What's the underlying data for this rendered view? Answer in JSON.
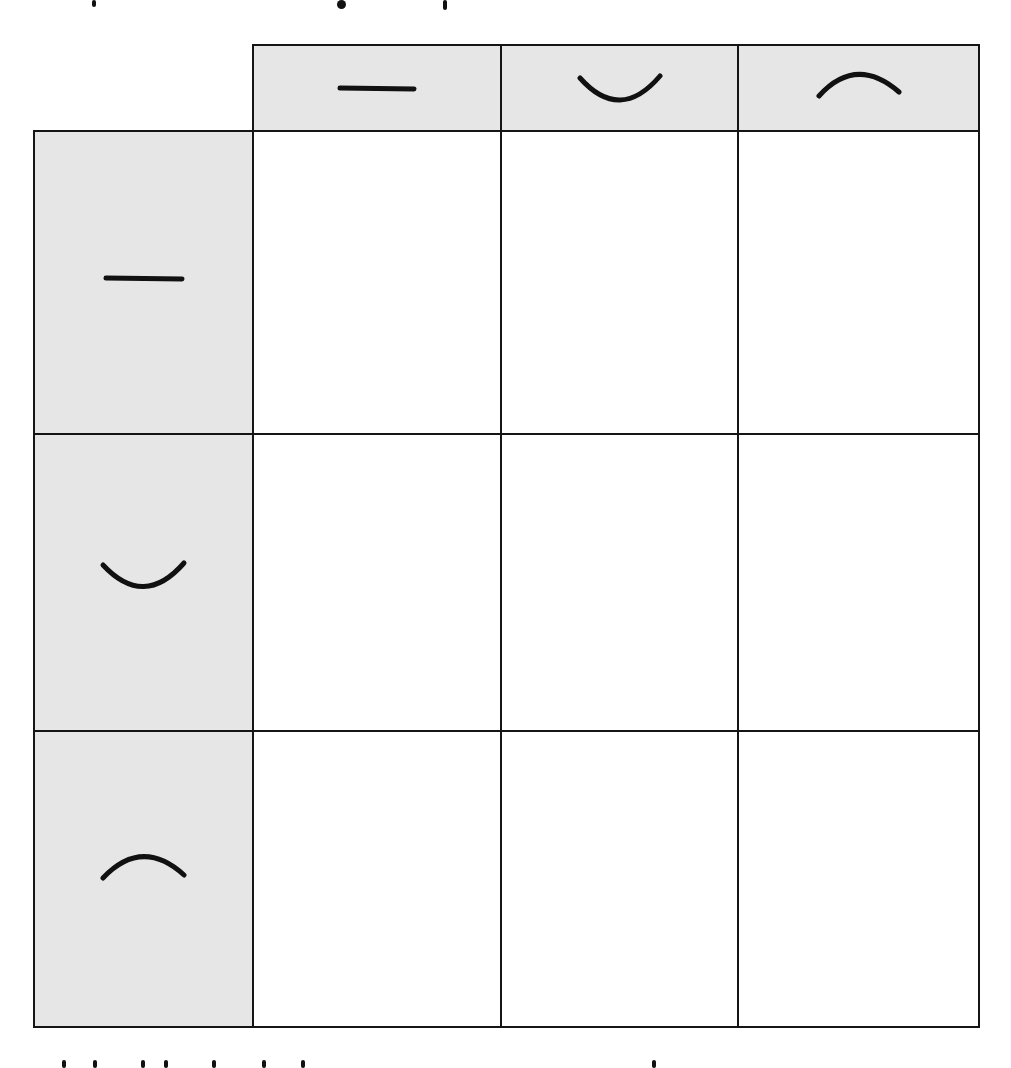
{
  "worksheet": {
    "top_text": {
      "visible": "cropped",
      "note_fragments": [
        "descender",
        "descender",
        "descender"
      ]
    },
    "bottom_text": {
      "visible": "cropped"
    },
    "colors": {
      "header_fill": "#e6e6e6",
      "cell_fill": "#ffffff",
      "line": "#151515"
    },
    "column_headers": [
      {
        "shape": "flat-line"
      },
      {
        "shape": "concave-up-curve"
      },
      {
        "shape": "concave-down-curve"
      }
    ],
    "row_headers": [
      {
        "shape": "flat-line"
      },
      {
        "shape": "concave-up-curve"
      },
      {
        "shape": "concave-down-curve"
      }
    ],
    "cells": [
      [
        "",
        "",
        ""
      ],
      [
        "",
        "",
        ""
      ],
      [
        "",
        "",
        ""
      ]
    ]
  }
}
